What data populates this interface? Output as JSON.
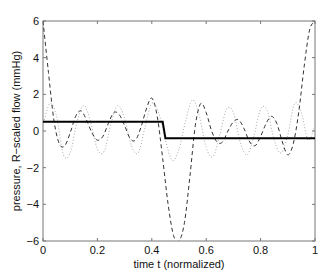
{
  "chart_data": {
    "type": "line",
    "title": "",
    "xlabel": "time t (normalized)",
    "ylabel": "pressure, R−scaled flow (mmHg)",
    "xlim": [
      0,
      1
    ],
    "ylim": [
      -6,
      6
    ],
    "xticks": [
      0,
      0.2,
      0.4,
      0.6,
      0.8,
      1
    ],
    "xtick_labels": [
      "0",
      "0.2",
      "0.4",
      "0.6",
      "0.8",
      "1"
    ],
    "yticks": [
      -6,
      -4,
      -2,
      0,
      2,
      4,
      6
    ],
    "ytick_labels": [
      "−6",
      "−4",
      "−2",
      "0",
      "2",
      "4",
      "6"
    ],
    "grid": false,
    "legend": null,
    "series": [
      {
        "name": "pressure (step)",
        "style": "solid",
        "color": "#000000",
        "x": [
          0,
          0.44,
          0.45,
          1
        ],
        "y": [
          0.5,
          0.5,
          -0.4,
          -0.4
        ]
      },
      {
        "name": "Fourier reconstruction (dashed)",
        "style": "dashed",
        "color": "#333333",
        "x": [
          0,
          0.02,
          0.04,
          0.06,
          0.08,
          0.1,
          0.12,
          0.14,
          0.16,
          0.18,
          0.2,
          0.22,
          0.24,
          0.26,
          0.28,
          0.3,
          0.32,
          0.34,
          0.36,
          0.38,
          0.4,
          0.42,
          0.44,
          0.46,
          0.48,
          0.5,
          0.52,
          0.54,
          0.56,
          0.58,
          0.6,
          0.62,
          0.64,
          0.66,
          0.68,
          0.7,
          0.72,
          0.74,
          0.76,
          0.78,
          0.8,
          0.82,
          0.84,
          0.86,
          0.88,
          0.9,
          0.92,
          0.94,
          0.96,
          0.98,
          1
        ],
        "y": [
          6.0,
          3.2,
          0.6,
          -0.7,
          -0.8,
          -0.1,
          0.8,
          1.1,
          0.6,
          -0.1,
          -0.5,
          -0.3,
          0.4,
          1.0,
          0.9,
          0.3,
          -0.4,
          -0.5,
          0.2,
          1.2,
          1.8,
          0.8,
          -1.5,
          -4.0,
          -5.7,
          -6.0,
          -5.0,
          -2.5,
          0.3,
          1.5,
          1.0,
          0.0,
          -0.6,
          -0.6,
          0.0,
          0.5,
          0.6,
          0.1,
          -0.6,
          -0.8,
          -0.3,
          0.4,
          0.8,
          0.4,
          -0.6,
          -1.3,
          -0.7,
          1.0,
          3.5,
          5.5,
          6.0
        ]
      },
      {
        "name": "R-scaled flow (dotted)",
        "style": "dotted",
        "color": "#aaaaaa",
        "x": [
          0,
          0.025,
          0.05,
          0.075,
          0.1,
          0.125,
          0.15,
          0.175,
          0.2,
          0.225,
          0.25,
          0.275,
          0.3,
          0.325,
          0.35,
          0.375,
          0.4,
          0.425,
          0.45,
          0.475,
          0.5,
          0.525,
          0.55,
          0.575,
          0.6,
          0.625,
          0.65,
          0.675,
          0.7,
          0.725,
          0.75,
          0.775,
          0.8,
          0.825,
          0.85,
          0.875,
          0.9,
          0.925,
          0.95,
          0.975,
          1
        ],
        "y": [
          0.3,
          1.5,
          0.8,
          -1.3,
          -1.2,
          0.5,
          1.4,
          0.5,
          -1.0,
          -1.1,
          0.4,
          1.4,
          0.7,
          -0.8,
          -1.2,
          0.2,
          1.5,
          1.0,
          -0.5,
          -1.6,
          -1.0,
          0.6,
          1.7,
          0.8,
          -0.9,
          -1.4,
          -0.2,
          1.2,
          1.0,
          -0.6,
          -1.3,
          -0.3,
          1.2,
          1.1,
          -0.5,
          -1.2,
          -0.2,
          1.5,
          1.0,
          -0.5,
          0.3
        ]
      }
    ]
  }
}
